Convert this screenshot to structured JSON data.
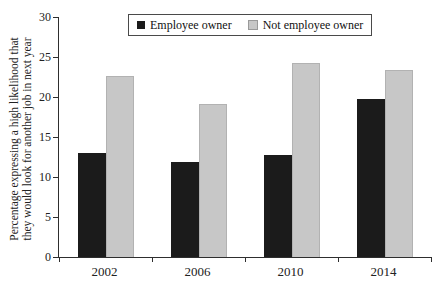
{
  "chart_data": {
    "type": "bar",
    "title": "",
    "categories": [
      "2002",
      "2006",
      "2010",
      "2014"
    ],
    "series": [
      {
        "name": "Employee owner",
        "color": "#1b1b1b",
        "values": [
          13.0,
          11.9,
          12.7,
          19.7
        ]
      },
      {
        "name": "Not employee owner",
        "color": "#c7c7c7",
        "values": [
          22.6,
          19.1,
          24.3,
          23.4
        ]
      }
    ],
    "ylabel_lines": [
      "Percentage expressing a high likelihood that",
      "they would look for another job in next year"
    ],
    "xlabel": "",
    "ylim": [
      0,
      30
    ],
    "yticks": [
      0,
      5,
      10,
      15,
      20,
      25,
      30
    ],
    "grid": false,
    "legend_position": "top-center",
    "axis_color": "#2e2e2e",
    "background_color": "#ffffff"
  }
}
